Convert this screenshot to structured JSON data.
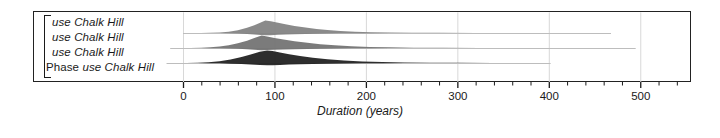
{
  "chart_data": {
    "type": "area",
    "title": "",
    "xlabel": "Duration (years)",
    "ylabel": "",
    "xlim": [
      -22,
      585
    ],
    "grid": true,
    "grid_axis": "x",
    "legend": "none",
    "axis": {
      "major_ticks": [
        0,
        100,
        200,
        300,
        400,
        500
      ],
      "major_tick_labels": [
        "0",
        "100",
        "200",
        "300",
        "400",
        "500"
      ],
      "minor_tick_step": 20,
      "minor_tick_start": 0,
      "minor_tick_end": 580
    },
    "rows": [
      {
        "label_prefix": "",
        "label": "use Chalk Hill",
        "baseline_start": 0,
        "baseline_end": 468,
        "peak": 90,
        "shade": "#808080",
        "points": [
          [
            8,
            0.0
          ],
          [
            20,
            0.01
          ],
          [
            30,
            0.02
          ],
          [
            40,
            0.05
          ],
          [
            50,
            0.11
          ],
          [
            60,
            0.22
          ],
          [
            70,
            0.42
          ],
          [
            78,
            0.62
          ],
          [
            85,
            0.85
          ],
          [
            90,
            1.0
          ],
          [
            96,
            0.95
          ],
          [
            104,
            0.82
          ],
          [
            112,
            0.7
          ],
          [
            122,
            0.57
          ],
          [
            134,
            0.44
          ],
          [
            146,
            0.33
          ],
          [
            158,
            0.24
          ],
          [
            172,
            0.16
          ],
          [
            188,
            0.1
          ],
          [
            206,
            0.06
          ],
          [
            226,
            0.035
          ],
          [
            250,
            0.02
          ],
          [
            280,
            0.012
          ],
          [
            320,
            0.006
          ],
          [
            370,
            0.003
          ],
          [
            420,
            0.001
          ],
          [
            468,
            0.0
          ]
        ]
      },
      {
        "label_prefix": "",
        "label": "use Chalk Hill",
        "baseline_start": -14,
        "baseline_end": 495,
        "peak": 86,
        "shade": "#707070",
        "points": [
          [
            -6,
            0.0
          ],
          [
            8,
            0.01
          ],
          [
            20,
            0.03
          ],
          [
            30,
            0.06
          ],
          [
            40,
            0.12
          ],
          [
            50,
            0.22
          ],
          [
            60,
            0.38
          ],
          [
            70,
            0.58
          ],
          [
            78,
            0.8
          ],
          [
            86,
            1.0
          ],
          [
            92,
            0.92
          ],
          [
            100,
            0.8
          ],
          [
            110,
            0.68
          ],
          [
            122,
            0.55
          ],
          [
            136,
            0.42
          ],
          [
            150,
            0.31
          ],
          [
            166,
            0.22
          ],
          [
            184,
            0.15
          ],
          [
            204,
            0.09
          ],
          [
            226,
            0.055
          ],
          [
            252,
            0.03
          ],
          [
            284,
            0.017
          ],
          [
            324,
            0.008
          ],
          [
            374,
            0.003
          ],
          [
            430,
            0.001
          ],
          [
            495,
            0.0
          ]
        ]
      },
      {
        "label_prefix": "",
        "label": "use Chalk Hill",
        "baseline_start": -18,
        "baseline_end": 402,
        "peak": 92,
        "shade": "#1c1c1c",
        "points": [
          [
            -10,
            0.0
          ],
          [
            4,
            0.01
          ],
          [
            16,
            0.03
          ],
          [
            28,
            0.07
          ],
          [
            40,
            0.15
          ],
          [
            52,
            0.28
          ],
          [
            64,
            0.48
          ],
          [
            74,
            0.68
          ],
          [
            84,
            0.9
          ],
          [
            92,
            1.0
          ],
          [
            98,
            0.96
          ],
          [
            106,
            0.84
          ],
          [
            116,
            0.7
          ],
          [
            128,
            0.56
          ],
          [
            142,
            0.42
          ],
          [
            158,
            0.3
          ],
          [
            176,
            0.2
          ],
          [
            196,
            0.13
          ],
          [
            218,
            0.08
          ],
          [
            242,
            0.045
          ],
          [
            270,
            0.024
          ],
          [
            302,
            0.012
          ],
          [
            338,
            0.005
          ],
          [
            370,
            0.002
          ],
          [
            402,
            0.0
          ]
        ]
      },
      {
        "label_prefix": "Phase ",
        "label": "use Chalk Hill",
        "baseline_start": null,
        "baseline_end": null,
        "peak": null,
        "shade": null,
        "points": []
      }
    ]
  },
  "colors": {
    "frame": "#222222",
    "grid": "#d8d8d8",
    "tick": "#1a1a1a",
    "background": "#ffffff"
  }
}
